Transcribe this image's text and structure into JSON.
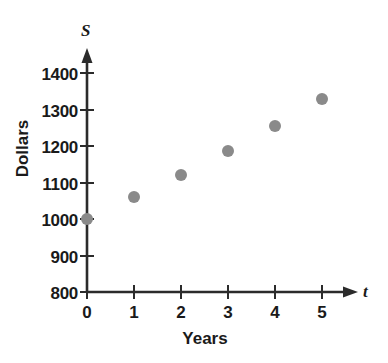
{
  "chart_data": {
    "type": "scatter",
    "title": "",
    "xlabel": "Years",
    "ylabel": "Dollars",
    "x_axis_variable": "t",
    "y_axis_variable": "S",
    "x": [
      0,
      1,
      2,
      3,
      4,
      5
    ],
    "values": [
      1000,
      1060,
      1120,
      1185,
      1255,
      1330
    ],
    "xtick_labels": [
      "0",
      "1",
      "2",
      "3",
      "4",
      "5"
    ],
    "ytick_labels": [
      "800",
      "900",
      "1000",
      "1100",
      "1200",
      "1300",
      "1400"
    ],
    "ytick_values": [
      800,
      900,
      1000,
      1100,
      1200,
      1300,
      1400
    ],
    "xlim": [
      0,
      5.6
    ],
    "ylim": [
      800,
      1430
    ],
    "grid": false,
    "legend": false,
    "marker_color": "#8a8a8a",
    "axis_color": "#2b2b2b",
    "series": [
      {
        "name": "Savings",
        "points": [
          {
            "t": 0,
            "s": 1000
          },
          {
            "t": 1,
            "s": 1060
          },
          {
            "t": 2,
            "s": 1120
          },
          {
            "t": 3,
            "s": 1185
          },
          {
            "t": 4,
            "s": 1255
          },
          {
            "t": 5,
            "s": 1330
          }
        ]
      }
    ]
  }
}
